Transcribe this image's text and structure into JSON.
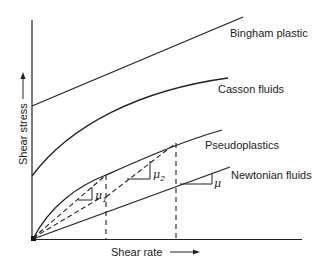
{
  "diagram": {
    "axes": {
      "x_label": "Shear rate",
      "y_label": "Shear stress"
    },
    "curves": [
      {
        "name": "Bingham plastic",
        "type": "linear with yield stress"
      },
      {
        "name": "Casson fluids",
        "type": "curved with yield stress"
      },
      {
        "name": "Pseudoplastics",
        "type": "shear-thinning curve through origin"
      },
      {
        "name": "Newtonian fluids",
        "type": "linear through origin"
      }
    ],
    "slope_labels": {
      "mu": "μ",
      "mu1_base": "μ",
      "mu1_sub": "1",
      "mu2_base": "μ",
      "mu2_sub": "2"
    },
    "colors": {
      "line": "#222222",
      "background": "#ffffff"
    }
  }
}
